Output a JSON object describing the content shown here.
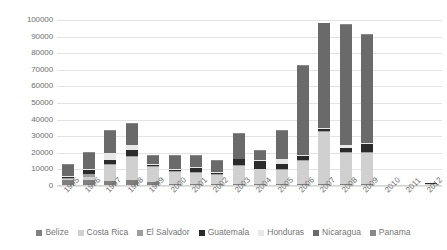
{
  "chart_data": {
    "type": "bar",
    "subtype": "stacked-column",
    "title": "",
    "xlabel": "",
    "ylabel": "",
    "ylim": [
      0,
      100000
    ],
    "ytick_step": 10000,
    "yticks": [
      0,
      10000,
      20000,
      30000,
      40000,
      50000,
      60000,
      70000,
      80000,
      90000,
      100000
    ],
    "ytick_labels": [
      "0",
      "10000",
      "20000",
      "30000",
      "40000",
      "50000",
      "60000",
      "70000",
      "80000",
      "90000",
      "100000"
    ],
    "grid": true,
    "legend_position": "bottom",
    "categories": [
      "1995",
      "1996",
      "1997",
      "1998",
      "1999",
      "2000",
      "2001",
      "2002",
      "2003",
      "2004",
      "2005",
      "2006",
      "2007",
      "2008",
      "2009",
      "2010",
      "2011",
      "2012"
    ],
    "series": [
      {
        "name": "Belize",
        "color": "#808080",
        "values": [
          3500,
          3500,
          3000,
          3500,
          2500,
          1500,
          1500,
          1000,
          1500,
          1500,
          1500,
          1500,
          1500,
          1500,
          1000,
          0,
          0,
          500
        ]
      },
      {
        "name": "Costa Rica",
        "color": "#d0d0d0",
        "values": [
          1000,
          2000,
          9500,
          14000,
          9000,
          7000,
          6500,
          5500,
          10500,
          8500,
          8000,
          13500,
          31000,
          18500,
          19000,
          400,
          400,
          900
        ]
      },
      {
        "name": "El Salvador",
        "color": "#9e9e9e",
        "values": [
          500,
          1500,
          500,
          500,
          500,
          500,
          500,
          500,
          500,
          500,
          500,
          500,
          500,
          500,
          500,
          0,
          0,
          0
        ]
      },
      {
        "name": "Guatemala",
        "color": "#2b2b2b",
        "values": [
          500,
          2500,
          2500,
          3500,
          500,
          500,
          2500,
          1000,
          3500,
          4500,
          3500,
          2500,
          1500,
          2500,
          5000,
          0,
          0,
          400
        ]
      },
      {
        "name": "Honduras",
        "color": "#e8e8e8",
        "values": [
          500,
          500,
          4500,
          3000,
          500,
          500,
          500,
          500,
          500,
          500,
          2500,
          500,
          500,
          2000,
          500,
          0,
          0,
          0
        ]
      },
      {
        "name": "Nicaragua",
        "color": "#6a6a6a",
        "values": [
          6500,
          10000,
          13000,
          13000,
          5000,
          8000,
          6500,
          6500,
          15000,
          5500,
          17000,
          54000,
          63000,
          72000,
          65000,
          0,
          0,
          0
        ]
      },
      {
        "name": "Panama",
        "color": "#888888",
        "values": [
          500,
          500,
          500,
          500,
          500,
          500,
          500,
          500,
          500,
          500,
          500,
          500,
          500,
          500,
          500,
          0,
          0,
          0
        ]
      }
    ]
  },
  "legend": {
    "items": [
      {
        "label": "Belize",
        "color": "#808080"
      },
      {
        "label": "Costa Rica",
        "color": "#d0d0d0"
      },
      {
        "label": "El Salvador",
        "color": "#9e9e9e"
      },
      {
        "label": "Guatemala",
        "color": "#2b2b2b"
      },
      {
        "label": "Honduras",
        "color": "#e8e8e8"
      },
      {
        "label": "Nicaragua",
        "color": "#6a6a6a"
      },
      {
        "label": "Panama",
        "color": "#888888"
      }
    ]
  },
  "colors": {
    "gridline": "#e3e3e3",
    "axis_text": "#6e6e6e",
    "legend_text": "#767676",
    "background": "#ffffff"
  }
}
